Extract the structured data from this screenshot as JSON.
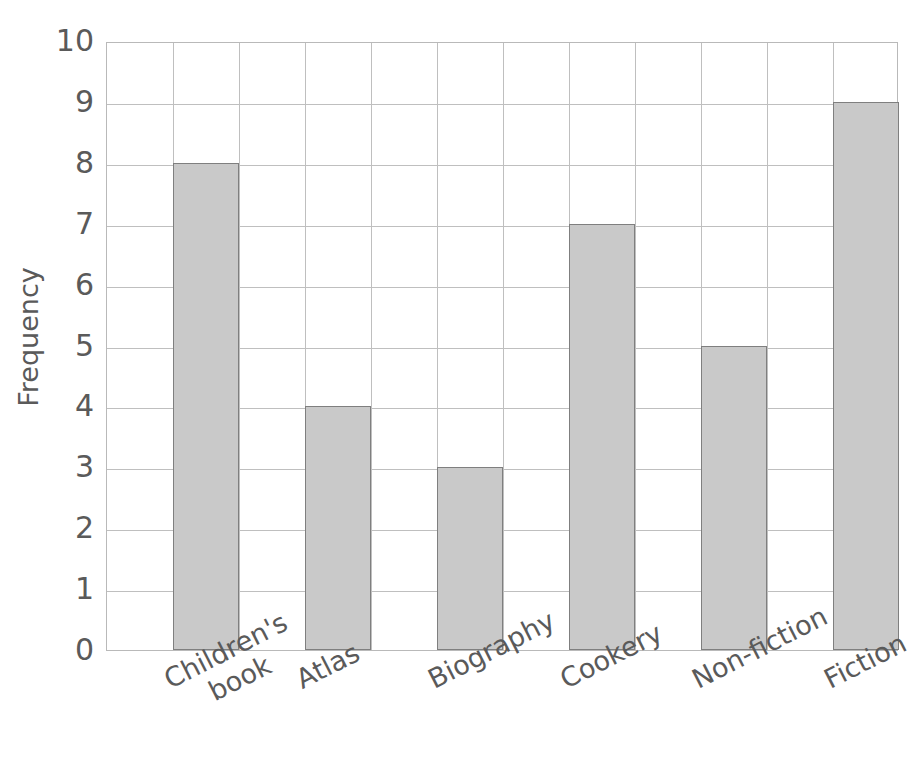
{
  "chart_data": {
    "type": "bar",
    "title": "",
    "subtitle": "",
    "xlabel": "",
    "ylabel": "Frequency",
    "categories": [
      "Children's\nbook",
      "Atlas",
      "Biography",
      "Cookery",
      "Non-fiction",
      "Fiction"
    ],
    "values": [
      8,
      4,
      3,
      7,
      5,
      9
    ],
    "ylim": [
      0,
      10
    ],
    "y_ticks": [
      0,
      1,
      2,
      3,
      4,
      5,
      6,
      7,
      8,
      9,
      10
    ],
    "y_tick_labels": [
      "0",
      "1",
      "2",
      "3",
      "4",
      "5",
      "6",
      "7",
      "8",
      "9",
      "10"
    ],
    "grid": true,
    "grid_axis": "both",
    "legend": false,
    "legend_position": "none",
    "bar_fill_color": "#c9c9c9",
    "bar_edge_color": "#7f7f7f",
    "grid_color": "#bfbfbf",
    "text_color": "#5a5a5a",
    "background_color": "#ffffff",
    "x_tick_label_rotation": -27
  }
}
